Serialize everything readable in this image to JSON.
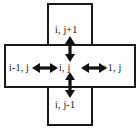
{
  "diagram": {
    "background_color": "#ffffff",
    "line_color": "#1a1a1a",
    "nodes": {
      "top": "i, j+1",
      "left": "i-1, j",
      "center": "i, j",
      "right": "i+1, j",
      "bottom": "i, j-1"
    },
    "connectors": [
      {
        "name": "center-to-top",
        "style": "double-headed-arrow",
        "orientation": "vertical"
      },
      {
        "name": "center-to-bottom",
        "style": "double-headed-arrow",
        "orientation": "vertical"
      },
      {
        "name": "center-to-left",
        "style": "double-headed-arrow",
        "orientation": "horizontal"
      },
      {
        "name": "center-to-right",
        "style": "double-headed-arrow",
        "orientation": "horizontal"
      }
    ],
    "shapes": [
      {
        "name": "vertical-rectangle",
        "stroke": "#1a1a1a"
      },
      {
        "name": "horizontal-rectangle",
        "stroke": "#1a1a1a"
      }
    ]
  }
}
